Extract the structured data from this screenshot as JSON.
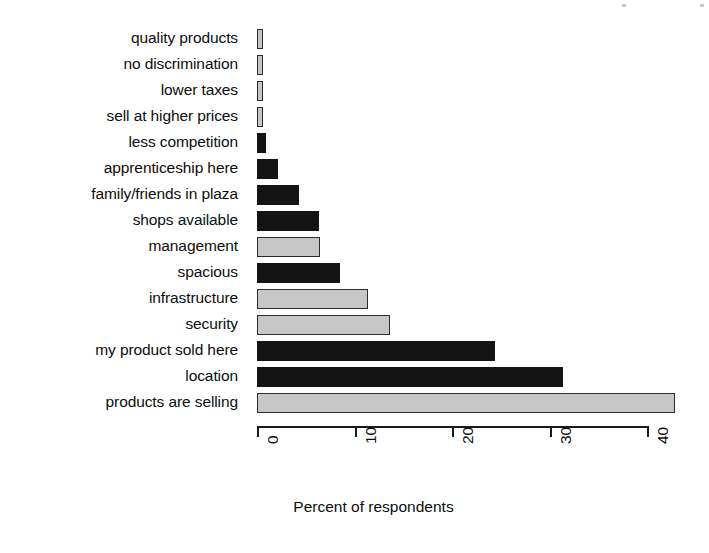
{
  "chart_data": {
    "type": "bar",
    "orientation": "horizontal",
    "title": "",
    "subtitle": "",
    "xlabel": "Percent of respondents",
    "ylabel": "",
    "xlim": [
      0,
      44
    ],
    "grid": false,
    "legend": null,
    "xticks": [
      "0",
      "10",
      "20",
      "30",
      "40"
    ],
    "xtick_values": [
      0,
      10,
      20,
      30,
      40
    ],
    "categories": [
      "quality products",
      "no discrimination",
      "lower taxes",
      "sell at higher prices",
      "less competition",
      "apprenticeship here",
      "family/friends in plaza",
      "shops available",
      "management",
      "spacious",
      "infrastructure",
      "security",
      "my product sold here",
      "location",
      "products are selling"
    ],
    "values": [
      0.6,
      0.6,
      0.6,
      0.6,
      0.9,
      2.2,
      4.3,
      6.4,
      6.5,
      8.5,
      11.4,
      13.6,
      24.4,
      31.4,
      42.8
    ],
    "bar_colors": [
      "light",
      "light",
      "light",
      "light",
      "dark",
      "dark",
      "dark",
      "dark",
      "light",
      "dark",
      "light",
      "light",
      "dark",
      "dark",
      "light"
    ],
    "colors": {
      "dark": "#141414",
      "light": "#c6c6c6",
      "outline": "#1a1a1a",
      "text": "#0d0d0d",
      "background": "#ffffff"
    }
  }
}
